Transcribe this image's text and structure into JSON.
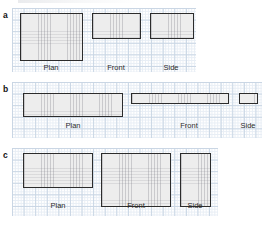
{
  "figure": {
    "grid_line_color": "#c9d6e4",
    "grid_subline_color": "#e8eef5",
    "shape_stroke_color": "#2c2c2c",
    "shape_fill_color": "#ededed",
    "grid_square_px": 11.6
  },
  "panels": [
    {
      "letter": "a",
      "letter_x": 3,
      "letter_y": 11,
      "grid": {
        "x": 12,
        "y": 8,
        "w": 184,
        "h": 64
      },
      "views": [
        {
          "name": "Plan",
          "label": "Plan",
          "shape": {
            "x": 20,
            "y": 13,
            "w": 63,
            "h": 48
          },
          "label_x": 51,
          "label_y": 64,
          "grid_units": {
            "w": 5.4,
            "h": 4.1
          }
        },
        {
          "name": "Front",
          "label": "Front",
          "shape": {
            "x": 92,
            "y": 13,
            "w": 49,
            "h": 26
          },
          "label_x": 116,
          "label_y": 64,
          "grid_units": {
            "w": 4.2,
            "h": 2.2
          }
        },
        {
          "name": "Side",
          "label": "Side",
          "shape": {
            "x": 150,
            "y": 13,
            "w": 44,
            "h": 26
          },
          "label_x": 171,
          "label_y": 64,
          "grid_units": {
            "w": 3.8,
            "h": 2.2
          }
        }
      ]
    },
    {
      "letter": "b",
      "letter_x": 3,
      "letter_y": 85,
      "grid": {
        "x": 12,
        "y": 82,
        "w": 250,
        "h": 56
      },
      "views": [
        {
          "name": "Plan",
          "label": "Plan",
          "shape": {
            "x": 23,
            "y": 93,
            "w": 100,
            "h": 24
          },
          "label_x": 73,
          "label_y": 122,
          "grid_units": {
            "w": 8.6,
            "h": 2.1
          }
        },
        {
          "name": "Front",
          "label": "Front",
          "shape": {
            "x": 131,
            "y": 93,
            "w": 98,
            "h": 11
          },
          "label_x": 189,
          "label_y": 122,
          "grid_units": {
            "w": 8.5,
            "h": 0.95
          }
        },
        {
          "name": "Side",
          "label": "Side",
          "shape": {
            "x": 239,
            "y": 93,
            "w": 19,
            "h": 11
          },
          "label_x": 248,
          "label_y": 122,
          "grid_units": {
            "w": 1.6,
            "h": 0.95
          }
        }
      ]
    },
    {
      "letter": "c",
      "letter_x": 3,
      "letter_y": 151,
      "grid": {
        "x": 12,
        "y": 148,
        "w": 206,
        "h": 68
      },
      "views": [
        {
          "name": "Plan",
          "label": "Plan",
          "shape": {
            "x": 23,
            "y": 153,
            "w": 70,
            "h": 35
          },
          "label_x": 58,
          "label_y": 202,
          "grid_units": {
            "w": 6.0,
            "h": 3.0
          }
        },
        {
          "name": "Front",
          "label": "Front",
          "shape": {
            "x": 101,
            "y": 153,
            "w": 70,
            "h": 54
          },
          "label_x": 136,
          "label_y": 202,
          "grid_units": {
            "w": 6.0,
            "h": 4.6
          }
        },
        {
          "name": "Side",
          "label": "Side",
          "shape": {
            "x": 180,
            "y": 153,
            "w": 31,
            "h": 54
          },
          "label_x": 195,
          "label_y": 202,
          "grid_units": {
            "w": 2.7,
            "h": 4.6
          }
        }
      ]
    }
  ]
}
